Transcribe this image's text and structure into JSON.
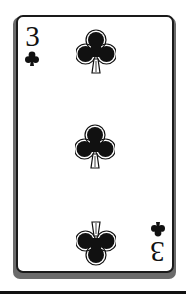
{
  "card": {
    "rank": "3",
    "suit": "clubs",
    "suit_glyph": "♣",
    "pip_count": 3,
    "pips": [
      {
        "position": "top",
        "orientation": "upright"
      },
      {
        "position": "center",
        "orientation": "upright"
      },
      {
        "position": "bottom",
        "orientation": "inverted"
      }
    ],
    "corner_indices": [
      {
        "position": "top-left",
        "rank": "3",
        "orientation": "upright"
      },
      {
        "position": "bottom-right",
        "rank": "3",
        "orientation": "inverted"
      }
    ]
  },
  "colors": {
    "ink": "#111111",
    "card_face": "#ffffff",
    "shadow": "#6b6b6b"
  }
}
